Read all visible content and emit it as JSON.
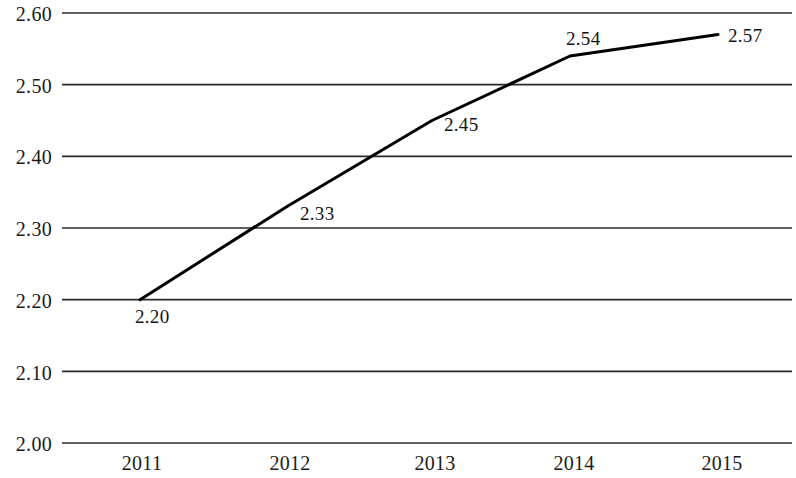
{
  "chart_data": {
    "type": "line",
    "title": "",
    "subtitle": "",
    "xlabel": "",
    "ylabel": "",
    "categories": [
      "2011",
      "2012",
      "2013",
      "2014",
      "2015"
    ],
    "values": [
      2.2,
      2.33,
      2.45,
      2.54,
      2.57
    ],
    "point_labels": [
      "2.20",
      "2.33",
      "2.45",
      "2.54",
      "2.57"
    ],
    "ylim": [
      2.0,
      2.6
    ],
    "ytick_labels": [
      "2.60",
      "2.50",
      "2.40",
      "2.30",
      "2.20",
      "2.10",
      "2.00"
    ],
    "ytick_values": [
      2.6,
      2.5,
      2.4,
      2.3,
      2.2,
      2.1,
      2.0
    ],
    "grid": true,
    "grid_axis": "y",
    "legend": null,
    "legend_position": "none",
    "series": [
      {
        "name": "",
        "values": [
          2.2,
          2.33,
          2.45,
          2.54,
          2.57
        ],
        "color": "#000000"
      }
    ],
    "colors": {
      "line": "#000000",
      "grid": "#2b2b2b",
      "text": "#141414",
      "background": "#ffffff"
    },
    "markers": false,
    "line_width": 3
  }
}
